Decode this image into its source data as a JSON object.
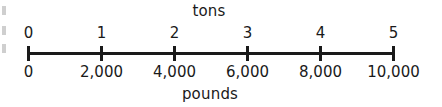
{
  "figure": {
    "type": "double-number-line",
    "top_axis_title": "tons",
    "bottom_axis_title": "pounds",
    "axis_color": "#1a1a1a",
    "background_color": "#ffffff"
  },
  "chart_data": {
    "type": "line",
    "title": "tons",
    "xlabel": "pounds",
    "ylabel": "",
    "grid": false,
    "legend": "none",
    "axis_count": 2,
    "top_axis": {
      "label": "tons",
      "tick_labels": [
        "0",
        "1",
        "2",
        "3",
        "4",
        "5"
      ],
      "values": [
        0,
        1,
        2,
        3,
        4,
        5
      ],
      "range": [
        0,
        5
      ]
    },
    "bottom_axis": {
      "label": "pounds",
      "tick_labels": [
        "0",
        "2,000",
        "4,000",
        "6,000",
        "8,000",
        "10,000"
      ],
      "values": [
        0,
        2000,
        4000,
        6000,
        8000,
        10000
      ],
      "range": [
        0,
        10000
      ]
    },
    "ticks": [
      {
        "x_px": 27,
        "tons": "0",
        "pounds": "0"
      },
      {
        "x_px": 100,
        "tons": "1",
        "pounds": "2,000"
      },
      {
        "x_px": 173,
        "tons": "2",
        "pounds": "4,000"
      },
      {
        "x_px": 246,
        "tons": "3",
        "pounds": "6,000"
      },
      {
        "x_px": 319,
        "tons": "4",
        "pounds": "8,000"
      },
      {
        "x_px": 392,
        "tons": "5",
        "pounds": "10,000"
      }
    ],
    "title_x_px": 209,
    "caption_x_px": 210
  }
}
